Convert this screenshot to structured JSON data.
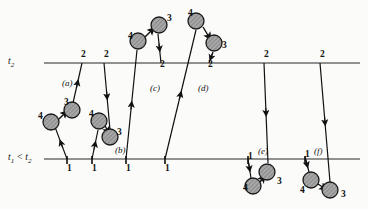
{
  "figure": {
    "kind": "spacetime-world-line-diagram",
    "axes": {
      "upper_label": "t₂",
      "lower_label": "t₁ < t₂",
      "upper_y": 63,
      "lower_y": 159,
      "line_color": "#6e6e6e"
    },
    "panels": [
      {
        "id": "a",
        "label": "(a)",
        "x": 62,
        "y": 79
      },
      {
        "id": "b",
        "label": "(b)",
        "x": 115,
        "y": 146
      },
      {
        "id": "c",
        "label": "(c)",
        "x": 150,
        "y": 84
      },
      {
        "id": "d",
        "label": "(d)",
        "x": 198,
        "y": 84
      },
      {
        "id": "e",
        "label": "(e)",
        "x": 258,
        "y": 147
      },
      {
        "id": "f",
        "label": "(f)",
        "x": 314,
        "y": 147
      }
    ],
    "endpoint_numbers": [
      {
        "text": "1",
        "x": 67,
        "y": 164
      },
      {
        "text": "1",
        "x": 92,
        "y": 164
      },
      {
        "text": "1",
        "x": 126,
        "y": 164
      },
      {
        "text": "1",
        "x": 165,
        "y": 164
      },
      {
        "text": "1",
        "x": 248,
        "y": 152
      },
      {
        "text": "1",
        "x": 305,
        "y": 150
      },
      {
        "text": "2",
        "x": 81,
        "y": 50
      },
      {
        "text": "2",
        "x": 104,
        "y": 50
      },
      {
        "text": "2",
        "x": 160,
        "y": 60
      },
      {
        "text": "2",
        "x": 208,
        "y": 60
      },
      {
        "text": "2",
        "x": 264,
        "y": 50
      },
      {
        "text": "2",
        "x": 320,
        "y": 50
      }
    ],
    "particle_numbers": [
      {
        "text": "4",
        "x": 38,
        "y": 112
      },
      {
        "text": "3",
        "x": 64,
        "y": 98
      },
      {
        "text": "4",
        "x": 89,
        "y": 110
      },
      {
        "text": "3",
        "x": 117,
        "y": 128
      },
      {
        "text": "4",
        "x": 128,
        "y": 32
      },
      {
        "text": "3",
        "x": 167,
        "y": 14
      },
      {
        "text": "4",
        "x": 188,
        "y": 9
      },
      {
        "text": "3",
        "x": 222,
        "y": 41
      },
      {
        "text": "4",
        "x": 243,
        "y": 184
      },
      {
        "text": "3",
        "x": 277,
        "y": 177
      },
      {
        "text": "4",
        "x": 300,
        "y": 186
      },
      {
        "text": "3",
        "x": 341,
        "y": 190
      }
    ],
    "balls": [
      {
        "cx": 51,
        "cy": 122,
        "r": 8
      },
      {
        "cx": 72,
        "cy": 110,
        "r": 8
      },
      {
        "cx": 99,
        "cy": 121,
        "r": 8
      },
      {
        "cx": 110,
        "cy": 137,
        "r": 8
      },
      {
        "cx": 138,
        "cy": 41,
        "r": 8
      },
      {
        "cx": 159,
        "cy": 25,
        "r": 8
      },
      {
        "cx": 196,
        "cy": 21,
        "r": 8
      },
      {
        "cx": 214,
        "cy": 43,
        "r": 8
      },
      {
        "cx": 253,
        "cy": 186,
        "r": 8
      },
      {
        "cx": 267,
        "cy": 172,
        "r": 8
      },
      {
        "cx": 311,
        "cy": 180,
        "r": 8
      },
      {
        "cx": 330,
        "cy": 190,
        "r": 8
      }
    ],
    "ball_style": {
      "fill": "#9d9d9d",
      "stroke": "#1a1a1a"
    },
    "world_lines": [
      {
        "panel": "a",
        "x1": 67,
        "y1": 159,
        "x2": 55,
        "y2": 127,
        "arrow": "up"
      },
      {
        "panel": "a",
        "x1": 73,
        "y1": 103,
        "x2": 82,
        "y2": 63,
        "arrow": "down"
      },
      {
        "panel": "b",
        "x1": 92,
        "y1": 159,
        "x2": 98,
        "y2": 130,
        "arrow": "up"
      },
      {
        "panel": "b",
        "x1": 104,
        "y1": 63,
        "x2": 110,
        "y2": 130,
        "arrow": "up"
      },
      {
        "panel": "c",
        "x1": 126,
        "y1": 159,
        "x2": 137,
        "y2": 50,
        "arrow": "up"
      },
      {
        "panel": "c",
        "x1": 158,
        "y1": 34,
        "x2": 161,
        "y2": 63,
        "arrow": "down"
      },
      {
        "panel": "d",
        "x1": 165,
        "y1": 159,
        "x2": 196,
        "y2": 30,
        "arrow": "up"
      },
      {
        "panel": "d",
        "x1": 213,
        "y1": 52,
        "x2": 209,
        "y2": 63,
        "arrow": "down"
      },
      {
        "panel": "e",
        "x1": 264,
        "y1": 63,
        "x2": 268,
        "y2": 163,
        "arrow": "down"
      },
      {
        "panel": "e",
        "x1": 248,
        "y1": 159,
        "x2": 251,
        "y2": 178,
        "arrow": "down"
      },
      {
        "panel": "f",
        "x1": 320,
        "y1": 63,
        "x2": 330,
        "y2": 182,
        "arrow": "down"
      },
      {
        "panel": "f",
        "x1": 305,
        "y1": 157,
        "x2": 309,
        "y2": 172,
        "arrow": "down"
      }
    ],
    "connectors": [
      {
        "x1": 59,
        "y1": 119,
        "x2": 65,
        "y2": 113
      },
      {
        "x1": 105,
        "y1": 126,
        "x2": 108,
        "y2": 131
      },
      {
        "x1": 145,
        "y1": 37,
        "x2": 152,
        "y2": 30
      },
      {
        "x1": 203,
        "y1": 27,
        "x2": 209,
        "y2": 37
      },
      {
        "x1": 260,
        "y1": 182,
        "x2": 263,
        "y2": 178
      },
      {
        "x1": 318,
        "y1": 184,
        "x2": 324,
        "y2": 188
      }
    ],
    "ticks": [
      {
        "x": 67,
        "y": 159
      },
      {
        "x": 92,
        "y": 159
      },
      {
        "x": 126,
        "y": 159
      },
      {
        "x": 165,
        "y": 159
      },
      {
        "x": 248,
        "y": 159
      },
      {
        "x": 305,
        "y": 159
      }
    ]
  }
}
